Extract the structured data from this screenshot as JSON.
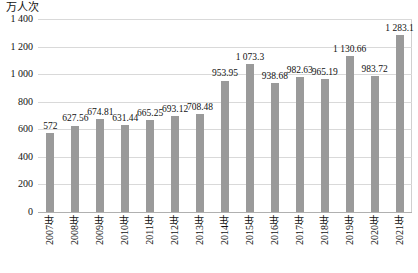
{
  "chart_data": {
    "type": "bar",
    "title": "",
    "xlabel": "",
    "ylabel": "万人次",
    "ylim": [
      0,
      1400
    ],
    "yticks": [
      "0",
      "200",
      "400",
      "600",
      "800",
      "1 000",
      "1 200",
      "1 400"
    ],
    "ytick_values": [
      0,
      200,
      400,
      600,
      800,
      1000,
      1200,
      1400
    ],
    "grid": true,
    "legend": "",
    "categories": [
      "2007年",
      "2008年",
      "2009年",
      "2010年",
      "2011年",
      "2012年",
      "2013年",
      "2014年",
      "2015年",
      "2016年",
      "2017年",
      "2018年",
      "2019年",
      "2020年",
      "2021年"
    ],
    "values": [
      572,
      627.56,
      674.81,
      631.44,
      665.25,
      693.12,
      708.48,
      953.95,
      1073.3,
      938.68,
      982.63,
      965.19,
      1130.66,
      983.72,
      1283.1
    ],
    "value_labels": [
      "572",
      "627.56",
      "674.81",
      "631.44",
      "665.25",
      "693.12",
      "708.48",
      "953.95",
      "1 073.3",
      "938.68",
      "982.63",
      "965.19",
      "1 130.66",
      "983.72",
      "1 283.1"
    ],
    "series": [
      {
        "name": "",
        "color": "#9a9a9a",
        "values": [
          572,
          627.56,
          674.81,
          631.44,
          665.25,
          693.12,
          708.48,
          953.95,
          1073.3,
          938.68,
          982.63,
          965.19,
          1130.66,
          983.72,
          1283.1
        ]
      }
    ]
  },
  "axis": {
    "unit_label": "万人次"
  },
  "caption": {
    "text": ""
  },
  "colors": {
    "bar": "#9a9a9a",
    "grid": "#d9d9d9",
    "baseline": "#b0b0b0",
    "text": "#111111"
  }
}
